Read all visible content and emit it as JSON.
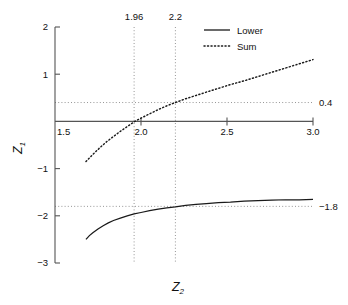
{
  "chart_data": {
    "type": "line",
    "title": "",
    "xlabel": "Z2",
    "ylabel": "Z1",
    "xlabel_base": "Z",
    "xlabel_sub": "2",
    "ylabel_base": "Z",
    "ylabel_sub": "1",
    "xlim": [
      1.5,
      3.0
    ],
    "ylim": [
      -3,
      2
    ],
    "xticks": [
      1.5,
      2.0,
      2.5,
      3.0
    ],
    "xtick_labels": [
      "1.5",
      "2.0",
      "2.5",
      "3.0"
    ],
    "yticks": [
      2,
      1,
      -1,
      -2,
      -3
    ],
    "ytick_labels": [
      "2",
      "1",
      "-1",
      "-2",
      "-3"
    ],
    "grid": true,
    "grid_style": "dotted",
    "vertical_guides": [
      {
        "x": 1.96,
        "label": "1.96",
        "label_position": "top"
      },
      {
        "x": 2.2,
        "label": "2.2",
        "label_position": "top"
      }
    ],
    "horizontal_guides": [
      {
        "y": 0.4,
        "label": "0.4",
        "label_position": "right"
      },
      {
        "y": -1.8,
        "label": "-1.8",
        "label_position": "right"
      }
    ],
    "legend_position": "top-right",
    "series": [
      {
        "name": "Lower",
        "style": "solid",
        "color": "#1a1a1a",
        "x": [
          1.68,
          1.7,
          1.72,
          1.75,
          1.78,
          1.81,
          1.84,
          1.88,
          1.92,
          1.96,
          2.0,
          2.05,
          2.1,
          2.15,
          2.2,
          2.26,
          2.32,
          2.38,
          2.45,
          2.52,
          2.6,
          2.68,
          2.76,
          2.84,
          2.92,
          3.0
        ],
        "values": [
          -2.5,
          -2.42,
          -2.36,
          -2.28,
          -2.21,
          -2.15,
          -2.1,
          -2.05,
          -2.0,
          -1.96,
          -1.93,
          -1.89,
          -1.86,
          -1.83,
          -1.81,
          -1.78,
          -1.76,
          -1.74,
          -1.72,
          -1.71,
          -1.69,
          -1.68,
          -1.67,
          -1.66,
          -1.66,
          -1.65
        ]
      },
      {
        "name": "Sum",
        "style": "dotted",
        "color": "#1a1a1a",
        "x": [
          1.68,
          1.72,
          1.76,
          1.8,
          1.84,
          1.88,
          1.92,
          1.96,
          2.0,
          2.05,
          2.1,
          2.15,
          2.2,
          2.26,
          2.32,
          2.38,
          2.45,
          2.52,
          2.6,
          2.68,
          2.76,
          2.84,
          2.92,
          3.0
        ],
        "values": [
          -0.85,
          -0.7,
          -0.56,
          -0.43,
          -0.32,
          -0.21,
          -0.11,
          -0.01,
          0.07,
          0.16,
          0.25,
          0.33,
          0.4,
          0.48,
          0.55,
          0.62,
          0.7,
          0.78,
          0.86,
          0.95,
          1.04,
          1.13,
          1.22,
          1.31
        ]
      }
    ]
  },
  "legend": {
    "items": [
      {
        "label": "Lower",
        "style": "solid"
      },
      {
        "label": "Sum",
        "style": "dotted"
      }
    ]
  }
}
